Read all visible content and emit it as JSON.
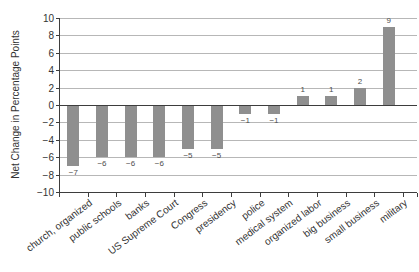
{
  "chart_data": {
    "type": "bar",
    "title": "",
    "xlabel": "",
    "ylabel": "Net Change in Percentage Points",
    "ylim": [
      -10,
      10
    ],
    "yticks": [
      10,
      8,
      6,
      4,
      2,
      0,
      -2,
      -4,
      -6,
      -8,
      -10
    ],
    "grid": true,
    "legend_position": "none",
    "categories": [
      "church, organized",
      "public schools",
      "banks",
      "US Supreme Court",
      "Congress",
      "presidency",
      "police",
      "medical system",
      "organized labor",
      "big business",
      "small business",
      "military"
    ],
    "values": [
      -7,
      -6,
      -6,
      -6,
      -5,
      -5,
      -1,
      -1,
      1,
      1,
      2,
      9
    ],
    "value_labels": [
      "-7",
      "-6",
      "-6",
      "-6",
      "-5",
      "-5",
      "-1",
      "-1",
      "1",
      "1",
      "2",
      "9"
    ],
    "colors": {
      "bar": "#8f8f8f",
      "gridline": "#b7b7b7",
      "axis": "#3d3d3d",
      "text": "#333333",
      "value_label": "#4d4d4d",
      "background": "#ffffff"
    }
  }
}
